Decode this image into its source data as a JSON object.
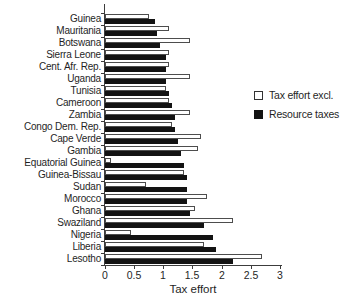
{
  "figure": {
    "width": 344,
    "height": 303
  },
  "chart_data": {
    "type": "bar",
    "orientation": "horizontal",
    "title": "",
    "xlabel": "Tax effort",
    "ylabel": "",
    "xlim": [
      0,
      3
    ],
    "xticks": [
      0,
      0.5,
      1,
      1.5,
      2,
      2.5,
      3
    ],
    "xtick_labels": [
      "0",
      "0.5",
      "1",
      "1.5",
      "2",
      "2.5",
      "3"
    ],
    "grid": false,
    "legend_position": "right",
    "categories": [
      "Guinea",
      "Mauritania",
      "Botswana",
      "Sierra Leone",
      "Cent. Afr. Rep.",
      "Uganda",
      "Tunisia",
      "Cameroon",
      "Zambia",
      "Congo Dem. Rep.",
      "Cape Verde",
      "Gambia",
      "Equatorial Guinea",
      "Guinea-Bissau",
      "Sudan",
      "Morocco",
      "Ghana",
      "Swaziland",
      "Nigeria",
      "Liberia",
      "Lesotho"
    ],
    "series": [
      {
        "name": "Tax effort excl.",
        "style": "open",
        "values": [
          0.75,
          1.1,
          1.45,
          1.1,
          1.1,
          1.45,
          1.05,
          1.1,
          1.45,
          1.15,
          1.65,
          1.6,
          0.1,
          1.35,
          0.7,
          1.75,
          1.55,
          2.2,
          0.45,
          1.7,
          2.7
        ]
      },
      {
        "name": "Resource taxes",
        "style": "filled",
        "values": [
          0.85,
          0.9,
          0.95,
          1.05,
          1.05,
          1.05,
          1.1,
          1.15,
          1.2,
          1.2,
          1.25,
          1.3,
          1.35,
          1.4,
          1.4,
          1.4,
          1.45,
          1.7,
          1.85,
          1.9,
          2.2
        ]
      }
    ]
  },
  "legend": {
    "items": [
      {
        "label": "Tax effort excl.",
        "swatch": "open"
      },
      {
        "label": "Resource taxes",
        "swatch": "filled"
      }
    ]
  },
  "axis": {
    "x_title": "Tax effort"
  },
  "colors": {
    "bar_filled": "#131313",
    "bar_open_fill": "#ffffff",
    "bar_open_border": "#4d4d4d",
    "axis": "#3c3c3c",
    "text": "#1f1f1f",
    "background": "#ffffff"
  }
}
